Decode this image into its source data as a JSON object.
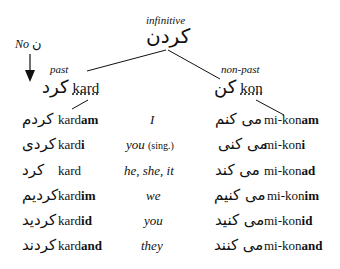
{
  "root": {
    "label": "infinitive",
    "persian": "کردن"
  },
  "annotation": {
    "text": "No",
    "persian": "ن"
  },
  "past": {
    "label": "past",
    "persian": "کرد",
    "roman": "kard"
  },
  "nonpast": {
    "label": "non-past",
    "persian": "کن",
    "roman": "kon"
  },
  "rows": [
    {
      "past_persian": "کردم",
      "past_stem": "kard",
      "past_ending": "am",
      "pronoun": "I",
      "pronoun_note": "",
      "nonpast_persian": "می کنم",
      "nonpast_stem": "mi-kon",
      "nonpast_ending": "am"
    },
    {
      "past_persian": "کردی",
      "past_stem": "kard",
      "past_ending": "i",
      "pronoun": "you",
      "pronoun_note": "(sing.)",
      "nonpast_persian": "می کنی",
      "nonpast_stem": "mi-kon",
      "nonpast_ending": "i"
    },
    {
      "past_persian": "کرد",
      "past_stem": "kard",
      "past_ending": "",
      "pronoun": "he, she, it",
      "pronoun_note": "",
      "nonpast_persian": "می کند",
      "nonpast_stem": "mi-kon",
      "nonpast_ending": "ad"
    },
    {
      "past_persian": "کردیم",
      "past_stem": "kard",
      "past_ending": "im",
      "pronoun": "we",
      "pronoun_note": "",
      "nonpast_persian": "می کنیم",
      "nonpast_stem": "mi-kon",
      "nonpast_ending": "im"
    },
    {
      "past_persian": "کردید",
      "past_stem": "kard",
      "past_ending": "id",
      "pronoun": "you",
      "pronoun_note": "",
      "nonpast_persian": "می کنید",
      "nonpast_stem": "mi-kon",
      "nonpast_ending": "id"
    },
    {
      "past_persian": "کردند",
      "past_stem": "kard",
      "past_ending": "and",
      "pronoun": "they",
      "pronoun_note": "",
      "nonpast_persian": "می کنند",
      "nonpast_stem": "mi-kon",
      "nonpast_ending": "and"
    }
  ]
}
